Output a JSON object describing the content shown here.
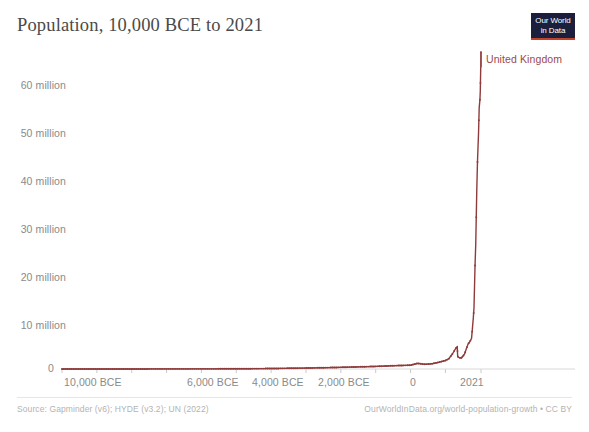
{
  "chart_data": {
    "type": "line",
    "title": "Population, 10,000 BCE to 2021",
    "xlabel": "",
    "ylabel": "",
    "grid": false,
    "legend_position": "inline-right-end",
    "series": [
      {
        "name": "United Kingdom",
        "color": "#8f3b3b",
        "x": [
          -10000,
          -9000,
          -8000,
          -7000,
          -6000,
          -5000,
          -4000,
          -3000,
          -2000,
          -1000,
          -500,
          0,
          200,
          400,
          600,
          800,
          1000,
          1100,
          1200,
          1300,
          1340,
          1350,
          1360,
          1400,
          1450,
          1500,
          1550,
          1600,
          1650,
          1700,
          1750,
          1800,
          1820,
          1850,
          1870,
          1900,
          1920,
          1950,
          1970,
          1990,
          2000,
          2010,
          2021
        ],
        "values": [
          5000,
          8000,
          12000,
          20000,
          30000,
          45000,
          100000,
          200000,
          350000,
          550000,
          700000,
          800000,
          1200000,
          1000000,
          1100000,
          1400000,
          1800000,
          2200000,
          3200000,
          4400000,
          4800000,
          2900000,
          2600000,
          2400000,
          2300000,
          2700000,
          3200000,
          4300000,
          5300000,
          5800000,
          6500000,
          10800000,
          13000000,
          22000000,
          26500000,
          38000000,
          44000000,
          50100000,
          55600000,
          57200000,
          58900000,
          62700000,
          67300000
        ]
      }
    ],
    "y_axis": {
      "min": 0,
      "max": 68000000,
      "ticks": [
        {
          "value": 0,
          "label": "0"
        },
        {
          "value": 10000000,
          "label": "10 million"
        },
        {
          "value": 20000000,
          "label": "20 million"
        },
        {
          "value": 30000000,
          "label": "30 million"
        },
        {
          "value": 40000000,
          "label": "40 million"
        },
        {
          "value": 50000000,
          "label": "50 million"
        },
        {
          "value": 60000000,
          "label": "60 million"
        }
      ]
    },
    "x_axis": {
      "min": -10000,
      "max": 2021,
      "ticks": [
        {
          "value": -10000,
          "label": "10,000 BCE"
        },
        {
          "value": -9000,
          "label": ""
        },
        {
          "value": -8000,
          "label": ""
        },
        {
          "value": -7000,
          "label": ""
        },
        {
          "value": -6000,
          "label": "6,000 BCE"
        },
        {
          "value": -5000,
          "label": ""
        },
        {
          "value": -4000,
          "label": "4,000 BCE"
        },
        {
          "value": -3000,
          "label": ""
        },
        {
          "value": -2000,
          "label": "2,000 BCE"
        },
        {
          "value": -1000,
          "label": ""
        },
        {
          "value": 0,
          "label": "0"
        },
        {
          "value": 1000,
          "label": ""
        },
        {
          "value": 2021,
          "label": "2021"
        }
      ]
    },
    "annotations": [
      {
        "text": "United Kingdom",
        "at_x": 2021,
        "at_y": 67300000
      }
    ]
  },
  "header": {
    "title": "Population, 10,000 BCE to 2021"
  },
  "logo": {
    "line1": "Our World",
    "line2": "in Data",
    "accent_color": "#c0442c",
    "background_color": "#1b1f3b"
  },
  "axes": {
    "y_labels": [
      "60 million",
      "50 million",
      "40 million",
      "30 million",
      "20 million",
      "10 million",
      "0"
    ],
    "x_labels": [
      "10,000 BCE",
      "6,000 BCE",
      "4,000 BCE",
      "2,000 BCE",
      "0",
      "2021"
    ]
  },
  "series_label": {
    "text": "United Kingdom",
    "color": "#9c4a4a"
  },
  "footer": {
    "source": "Source: Gapminder (v6); HYDE (v3.2); UN (2022)",
    "license": "OurWorldInData.org/world-population-growth • CC BY"
  }
}
